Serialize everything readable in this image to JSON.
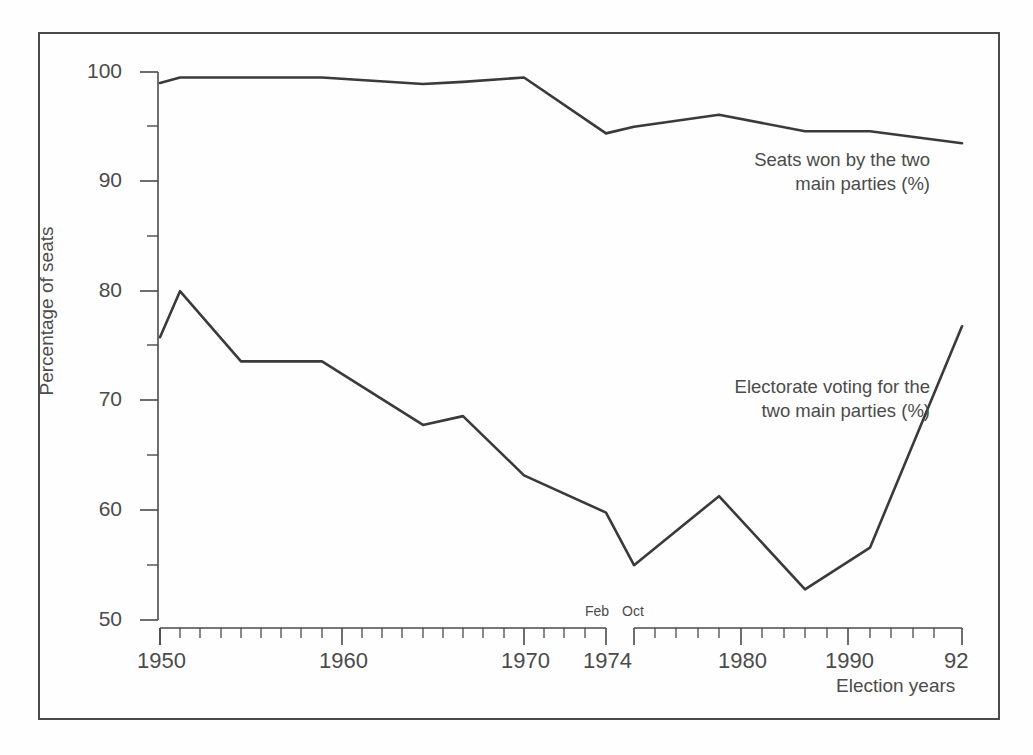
{
  "figure": {
    "frame": {
      "border_color": "#4a4a4a"
    },
    "line_color": "#3a3a3a",
    "background": "#fefefe"
  },
  "axes": {
    "y_title": "Percentage of seats",
    "x_title": "Election years",
    "y_ticks_major": [
      "50",
      "60",
      "70",
      "80",
      "90",
      "100"
    ],
    "y_ticks_minor": [
      "55",
      "65",
      "75",
      "85",
      "95"
    ],
    "x_tick_labels": [
      "1950",
      "1960",
      "1970",
      "1974",
      "1980",
      "1990",
      "92"
    ],
    "x_sublabels": [
      "Feb",
      "Oct"
    ]
  },
  "annotations": {
    "seats_note": "Seats won by the two\nmain parties (%)",
    "electorate_note": "Electorate voting for the\ntwo main parties (%)"
  },
  "chart_data": {
    "type": "line",
    "title": "",
    "xlabel": "Election years",
    "ylabel": "Percentage of seats",
    "ylim": [
      50,
      100
    ],
    "xlim": [
      1950,
      1992
    ],
    "grid": false,
    "legend": "inline annotations",
    "axis_break": {
      "at": 1974,
      "note": "1974 had two general elections: Feb and Oct"
    },
    "x": [
      1950,
      1951,
      1955,
      1959,
      1964,
      1966,
      1970,
      "1974 Feb",
      "1974 Oct",
      1979,
      1983,
      1987,
      1992
    ],
    "series": [
      {
        "name": "Seats won by the two main parties (%)",
        "values": [
          99.0,
          99.5,
          99.5,
          99.5,
          98.9,
          99.1,
          99.5,
          94.4,
          95.0,
          96.1,
          94.6,
          94.6,
          93.5
        ]
      },
      {
        "name": "Electorate voting for the two main parties (%)",
        "values": [
          75.8,
          80.0,
          73.6,
          73.6,
          67.8,
          68.6,
          63.2,
          59.8,
          55.0,
          61.3,
          52.8,
          56.6,
          76.8
        ]
      }
    ]
  }
}
